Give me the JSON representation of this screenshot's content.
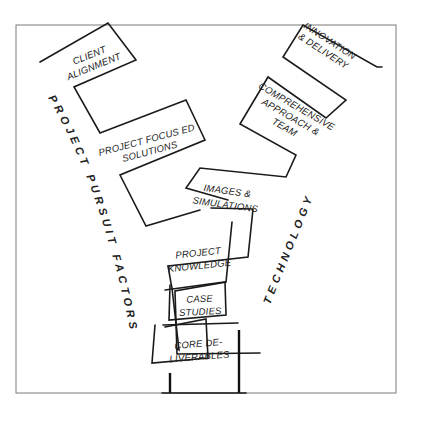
{
  "diagram": {
    "type": "y-funnel",
    "left_axis_label": "PROJECT PURSUIT FACTORS",
    "right_axis_label": "TECHNOLOGY",
    "boxes": [
      {
        "id": "client-alignment",
        "line1": "CLIENT",
        "line2": "ALIGNMENT",
        "line3": ""
      },
      {
        "id": "innovation-delivery",
        "line1": "INNOVATION",
        "line2": "& DELIVERY",
        "line3": ""
      },
      {
        "id": "comprehensive-approach-team",
        "line1": "COMPREHENSIVE",
        "line2": "APPROACH &",
        "line3": "TEAM"
      },
      {
        "id": "project-focused-solutions",
        "line1": "PROJECT FOCUS ED",
        "line2": "SOLUTIONS",
        "line3": ""
      },
      {
        "id": "images-simulations",
        "line1": "IMAGES &",
        "line2": "SIMULATIONS",
        "line3": ""
      },
      {
        "id": "project-knowledge",
        "line1": "PROJECT",
        "line2": "KNOWLEDGE",
        "line3": ""
      },
      {
        "id": "case-studies",
        "line1": "CASE",
        "line2": "STUDIES",
        "line3": ""
      },
      {
        "id": "core-deliverables",
        "line1": "CORE DE-",
        "line2": "LIVERABLES",
        "line3": ""
      }
    ],
    "colors": {
      "ink": "#1a1a1a",
      "frame": "#7a7a7a",
      "background": "#ffffff"
    }
  }
}
